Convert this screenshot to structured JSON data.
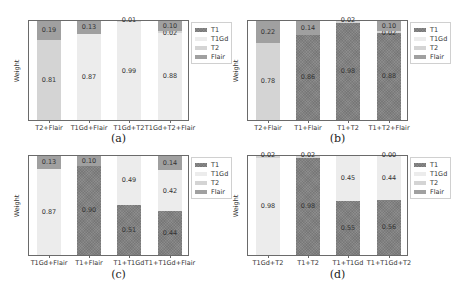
{
  "colors": {
    "T1": "#8c8c8c",
    "T1Gd": "#ececec",
    "T2": "#d4d4d4",
    "Flair": "#a0a0a0"
  },
  "chart_data": [
    {
      "type": "bar",
      "stacked": true,
      "caption": "(a)",
      "ylabel": "Weight",
      "legend": [
        "T1",
        "T1Gd",
        "T2",
        "Flair"
      ],
      "categories": [
        "T2+Flair",
        "T1Gd+Flair",
        "T1Gd+T2",
        "T1Gd+T2+Flair"
      ],
      "bars": [
        {
          "segments": [
            {
              "modality": "T2",
              "value": 0.81
            },
            {
              "modality": "Flair",
              "value": 0.19
            }
          ]
        },
        {
          "segments": [
            {
              "modality": "T1Gd",
              "value": 0.87
            },
            {
              "modality": "Flair",
              "value": 0.13
            }
          ]
        },
        {
          "segments": [
            {
              "modality": "T1Gd",
              "value": 0.99
            },
            {
              "modality": "T2",
              "value": 0.01
            }
          ]
        },
        {
          "segments": [
            {
              "modality": "T1Gd",
              "value": 0.88
            },
            {
              "modality": "T2",
              "value": 0.02
            },
            {
              "modality": "Flair",
              "value": 0.1
            }
          ]
        }
      ],
      "ylim": [
        0,
        1
      ]
    },
    {
      "type": "bar",
      "stacked": true,
      "caption": "(b)",
      "ylabel": "Weight",
      "legend": [
        "T1",
        "T1Gd",
        "T2",
        "Flair"
      ],
      "categories": [
        "T2+Flair",
        "T1+Flair",
        "T1+T2",
        "T1+T2+Flair"
      ],
      "bars": [
        {
          "segments": [
            {
              "modality": "T2",
              "value": 0.78
            },
            {
              "modality": "Flair",
              "value": 0.22
            }
          ]
        },
        {
          "segments": [
            {
              "modality": "T1",
              "value": 0.86
            },
            {
              "modality": "Flair",
              "value": 0.14
            }
          ]
        },
        {
          "segments": [
            {
              "modality": "T1",
              "value": 0.98
            },
            {
              "modality": "T2",
              "value": 0.02
            }
          ]
        },
        {
          "segments": [
            {
              "modality": "T1",
              "value": 0.88
            },
            {
              "modality": "T2",
              "value": 0.02
            },
            {
              "modality": "Flair",
              "value": 0.1
            }
          ]
        }
      ],
      "ylim": [
        0,
        1
      ]
    },
    {
      "type": "bar",
      "stacked": true,
      "caption": "(c)",
      "ylabel": "Weight",
      "legend": [
        "T1",
        "T1Gd",
        "T2",
        "Flair"
      ],
      "categories": [
        "T1Gd+Flair",
        "T1+Flair",
        "T1+T1Gd",
        "T1+T1Gd+Flair"
      ],
      "bars": [
        {
          "segments": [
            {
              "modality": "T1Gd",
              "value": 0.87
            },
            {
              "modality": "Flair",
              "value": 0.13
            }
          ]
        },
        {
          "segments": [
            {
              "modality": "T1",
              "value": 0.9
            },
            {
              "modality": "Flair",
              "value": 0.1
            }
          ]
        },
        {
          "segments": [
            {
              "modality": "T1",
              "value": 0.51
            },
            {
              "modality": "T1Gd",
              "value": 0.49
            }
          ]
        },
        {
          "segments": [
            {
              "modality": "T1",
              "value": 0.44
            },
            {
              "modality": "T1Gd",
              "value": 0.42
            },
            {
              "modality": "Flair",
              "value": 0.14
            }
          ]
        }
      ],
      "ylim": [
        0,
        1
      ]
    },
    {
      "type": "bar",
      "stacked": true,
      "caption": "(d)",
      "ylabel": "Weight",
      "legend": [
        "T1",
        "T1Gd",
        "T2",
        "Flair"
      ],
      "categories": [
        "T1Gd+T2",
        "T1+T2",
        "T1+T1Gd",
        "T1+T1Gd+T2"
      ],
      "bars": [
        {
          "segments": [
            {
              "modality": "T1Gd",
              "value": 0.98
            },
            {
              "modality": "T2",
              "value": 0.02
            }
          ]
        },
        {
          "segments": [
            {
              "modality": "T1",
              "value": 0.98
            },
            {
              "modality": "T2",
              "value": 0.02
            }
          ]
        },
        {
          "segments": [
            {
              "modality": "T1",
              "value": 0.55
            },
            {
              "modality": "T1Gd",
              "value": 0.45
            }
          ]
        },
        {
          "segments": [
            {
              "modality": "T1",
              "value": 0.56
            },
            {
              "modality": "T1Gd",
              "value": 0.44
            },
            {
              "modality": "T2",
              "value": 0.0
            }
          ]
        }
      ],
      "ylim": [
        0,
        1
      ]
    }
  ]
}
